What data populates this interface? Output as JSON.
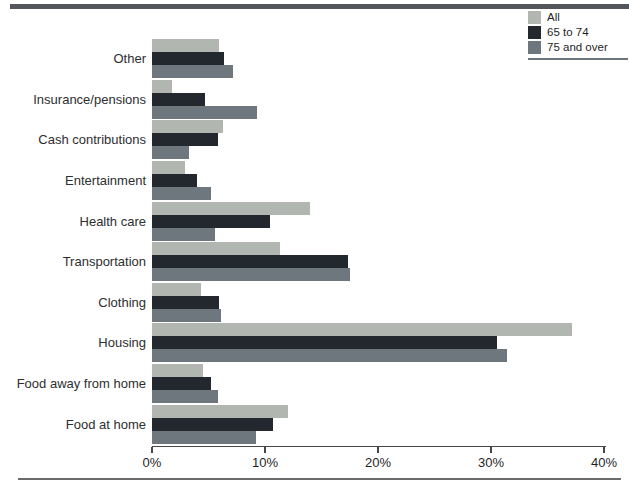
{
  "decorations": {
    "top_rule_color": "#53565a",
    "bottom_rule_color": "#6b6b6b",
    "axis_color": "#474747",
    "legend_underline_color": "#6d757c",
    "background": "#ffffff"
  },
  "legend": {
    "position": "top-right",
    "items": [
      {
        "label": "All",
        "color": "#b2b6b0"
      },
      {
        "label": "65 to 74",
        "color": "#23272e"
      },
      {
        "label": "75 and over",
        "color": "#6e777e"
      }
    ]
  },
  "chart_data": {
    "type": "bar",
    "orientation": "horizontal",
    "title": "",
    "xlabel": "",
    "ylabel": "",
    "grid": false,
    "legend_position": "top-right",
    "xlim": [
      0,
      40
    ],
    "x_ticks": [
      "0%",
      "10%",
      "20%",
      "30%",
      "40%"
    ],
    "categories": [
      "Other",
      "Insurance/pensions",
      "Cash contributions",
      "Entertainment",
      "Health care",
      "Transportation",
      "Clothing",
      "Housing",
      "Food away from home",
      "Food at home"
    ],
    "series": [
      {
        "name": "All",
        "color": "#b2b6b0",
        "values": [
          5.9,
          1.8,
          6.3,
          2.9,
          14.0,
          11.3,
          4.3,
          37.2,
          4.5,
          12.0
        ]
      },
      {
        "name": "65 to 74",
        "color": "#23272e",
        "values": [
          6.4,
          4.7,
          5.8,
          4.0,
          10.4,
          17.3,
          5.9,
          30.5,
          5.2,
          10.7
        ]
      },
      {
        "name": "75 and over",
        "color": "#6e777e",
        "values": [
          7.2,
          9.3,
          3.3,
          5.2,
          5.6,
          17.5,
          6.1,
          31.4,
          5.8,
          9.2
        ]
      }
    ]
  }
}
